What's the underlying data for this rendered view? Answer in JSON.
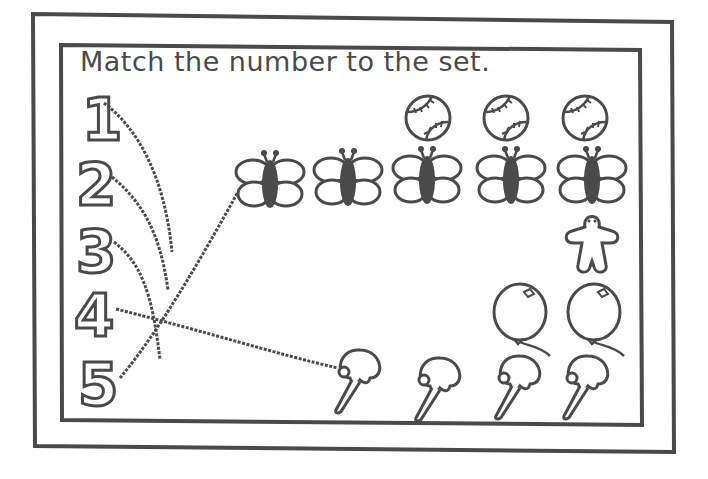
{
  "worksheet": {
    "title": "Match the number to the set.",
    "numbers": [
      "1",
      "2",
      "3",
      "4",
      "5"
    ],
    "sets": [
      {
        "object": "gingerbread-man",
        "count": 1
      },
      {
        "object": "balloon",
        "count": 2
      },
      {
        "object": "baseball",
        "count": 3
      },
      {
        "object": "ice-cream-cone",
        "count": 4
      },
      {
        "object": "butterfly",
        "count": 5
      }
    ],
    "drawn_lines": [
      {
        "from_number": "1",
        "ends_near": "middle-left, unfinished"
      },
      {
        "from_number": "2",
        "ends_near": "middle-left, unfinished"
      },
      {
        "from_number": "3",
        "ends_near": "middle-left, unfinished"
      },
      {
        "from_number": "4",
        "to_set": "ice-cream-cone"
      },
      {
        "from_number": "5",
        "to_set": "butterfly"
      }
    ],
    "colors": {
      "ink": "#4a4a4a",
      "paper": "#ffffff"
    }
  }
}
